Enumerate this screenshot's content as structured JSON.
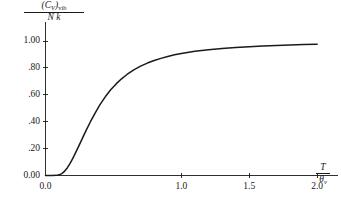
{
  "chart_data": {
    "type": "line",
    "title": "",
    "subtitle": "",
    "xlabel": "T / θ_v",
    "ylabel": "(C_V)_vib / Nk",
    "xlim": [
      0.0,
      2.08
    ],
    "ylim": [
      0.0,
      1.06
    ],
    "grid": false,
    "legend": null,
    "xticks": [
      0.0,
      1.0,
      1.5,
      2.0
    ],
    "xtick_labels": [
      "0.0",
      "1.0",
      "1.5",
      "2.0"
    ],
    "yticks": [
      0.0,
      0.2,
      0.4,
      0.6,
      0.8,
      1.0
    ],
    "ytick_labels": [
      "0.00",
      ".20",
      ".40",
      ".60",
      ".80",
      "1.00"
    ],
    "series": [
      {
        "name": "Einstein vibrational heat capacity",
        "color": "#1a1a1a",
        "x": [
          0.0,
          0.05,
          0.08,
          0.1,
          0.12,
          0.14,
          0.16,
          0.18,
          0.2,
          0.22,
          0.25,
          0.28,
          0.3,
          0.33,
          0.36,
          0.4,
          0.44,
          0.48,
          0.52,
          0.56,
          0.6,
          0.65,
          0.7,
          0.75,
          0.8,
          0.85,
          0.9,
          0.95,
          1.0,
          1.1,
          1.2,
          1.3,
          1.4,
          1.5,
          1.6,
          1.7,
          1.8,
          1.9,
          2.0
        ],
        "y": [
          0.0,
          0.0,
          0.001,
          0.005,
          0.014,
          0.031,
          0.056,
          0.088,
          0.125,
          0.166,
          0.23,
          0.295,
          0.337,
          0.398,
          0.455,
          0.525,
          0.585,
          0.637,
          0.681,
          0.719,
          0.751,
          0.785,
          0.813,
          0.836,
          0.855,
          0.871,
          0.885,
          0.897,
          0.907,
          0.923,
          0.935,
          0.944,
          0.952,
          0.958,
          0.963,
          0.967,
          0.971,
          0.974,
          0.976
        ]
      }
    ]
  },
  "ylabel_parts": {
    "numerator_open": "(",
    "numerator_symbol": "C",
    "numerator_symbol_sub": "V",
    "numerator_close": ")",
    "numerator_sub": "vib",
    "denominator": "N k"
  },
  "xlabel_parts": {
    "numerator": "T",
    "denominator_symbol": "θ",
    "denominator_sub": "v"
  },
  "axis_color": "#1a1a1a",
  "curve_color": "#1a1a1a",
  "background_color": "#ffffff"
}
